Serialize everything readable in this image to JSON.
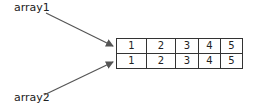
{
  "labels": {
    "array1": "array1",
    "array2": "array2"
  },
  "table": {
    "rows": [
      [
        "1",
        "2",
        "3",
        "4",
        "5"
      ],
      [
        "1",
        "2",
        "3",
        "4",
        "5"
      ]
    ]
  },
  "arrows": [
    {
      "from": "array1",
      "to": "table-row-1",
      "color": "#555555"
    },
    {
      "from": "array2",
      "to": "table-row-2",
      "color": "#555555"
    }
  ]
}
